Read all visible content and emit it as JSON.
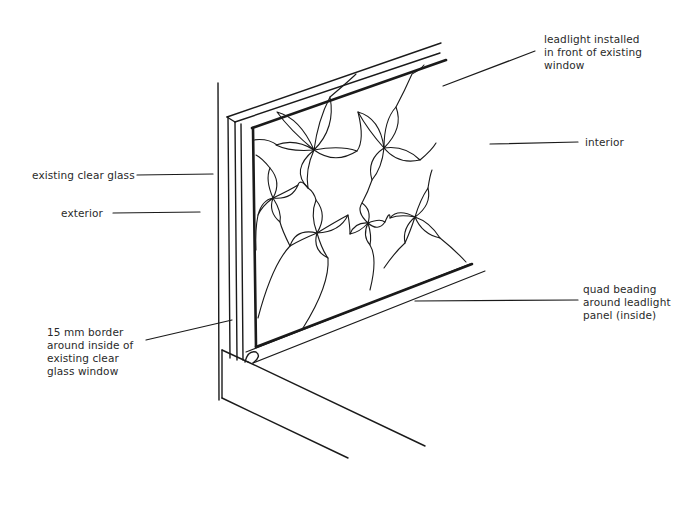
{
  "diagram": {
    "title": "",
    "labels": {
      "leadlight_installed": "leadlight installed\nin front of existing\nwindow",
      "interior": "interior",
      "existing_clear_glass": "existing clear glass",
      "exterior": "exterior",
      "border": "15 mm border\naround inside of\nexisting clear\nglass window",
      "quad_beading": "quad beading\naround leadlight\npanel (inside)"
    },
    "colors": {
      "line": "#1a1a1a",
      "text": "#2a2a2a",
      "background": "#ffffff"
    }
  }
}
